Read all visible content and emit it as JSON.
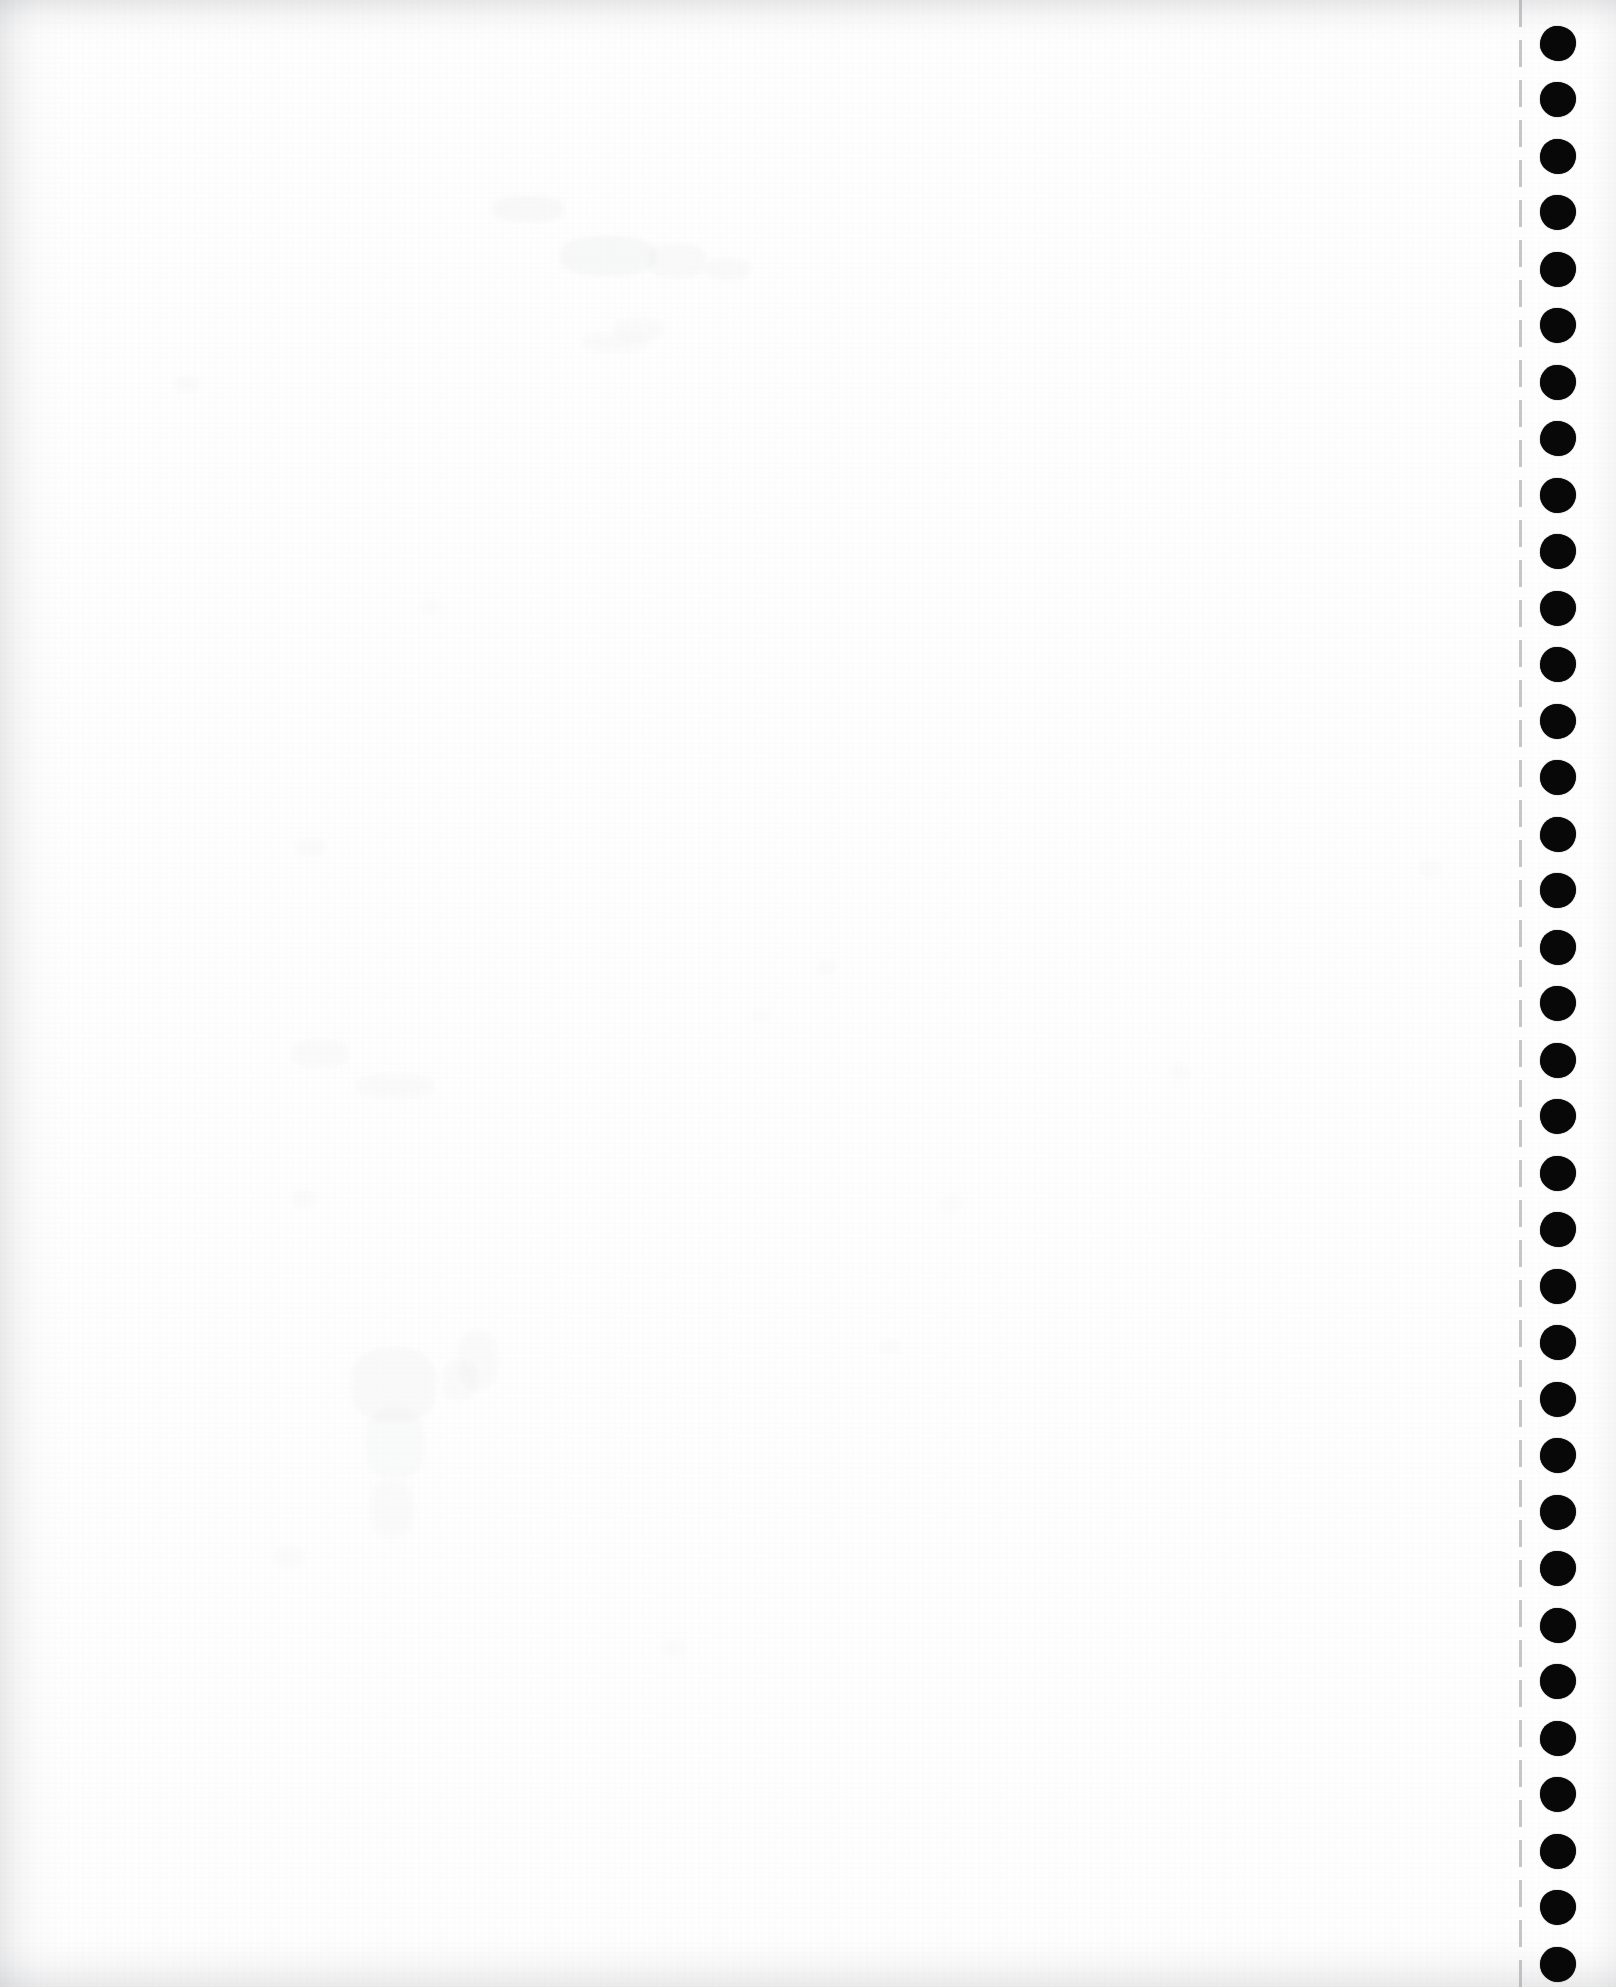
{
  "document": {
    "kind": "scanned-page",
    "media": "continuous tractor-feed fanfold computer paper",
    "page_state_label": "blank page",
    "width_px": 1616,
    "height_px": 1987,
    "background_color": "#ffffff",
    "ink_color": "#080808"
  },
  "content_area": {
    "label": "blank printable area",
    "text": "",
    "left_px": 0,
    "width_px": 1519,
    "visible_text_lines": []
  },
  "perforation": {
    "label": "tear-off perforation line",
    "x_px": 1519,
    "orientation": "vertical",
    "style": "dashed",
    "dash_length_px": 27,
    "gap_length_px": 13,
    "color": "#96989e"
  },
  "sprocket_strip": {
    "label": "pin-feed sprocket strip",
    "x_px": 1522,
    "width_px": 94,
    "hole_color": "#080808",
    "hole_diameter_px": 36,
    "hole_spacing_px": 56.5,
    "first_hole_center_y_px": 43,
    "hole_count": 35,
    "hole_centers_y_px": [
      43,
      99,
      156,
      212,
      269,
      325,
      382,
      438,
      495,
      551,
      608,
      664,
      721,
      777,
      834,
      890,
      947,
      1003,
      1060,
      1116,
      1173,
      1229,
      1286,
      1342,
      1399,
      1455,
      1512,
      1568,
      1625,
      1681,
      1738,
      1794,
      1851,
      1907,
      1964
    ]
  },
  "scan_artifacts": {
    "label": "scanner edge shading and paper grain",
    "edges": [
      "top",
      "left",
      "bottom",
      "right"
    ],
    "shade_color": "#96989c",
    "ghost_marks": [
      {
        "x": 492,
        "y": 196,
        "w": 72,
        "h": 26,
        "opacity": 0.05
      },
      {
        "x": 560,
        "y": 236,
        "w": 96,
        "h": 40,
        "opacity": 0.055
      },
      {
        "x": 648,
        "y": 244,
        "w": 58,
        "h": 34,
        "opacity": 0.045
      },
      {
        "x": 706,
        "y": 258,
        "w": 44,
        "h": 22,
        "opacity": 0.038
      },
      {
        "x": 614,
        "y": 318,
        "w": 50,
        "h": 22,
        "opacity": 0.03
      },
      {
        "x": 582,
        "y": 332,
        "w": 68,
        "h": 20,
        "opacity": 0.028
      },
      {
        "x": 174,
        "y": 376,
        "w": 26,
        "h": 16,
        "opacity": 0.028
      },
      {
        "x": 296,
        "y": 838,
        "w": 30,
        "h": 18,
        "opacity": 0.026
      },
      {
        "x": 818,
        "y": 960,
        "w": 18,
        "h": 14,
        "opacity": 0.024
      },
      {
        "x": 752,
        "y": 1010,
        "w": 16,
        "h": 12,
        "opacity": 0.022
      },
      {
        "x": 292,
        "y": 1040,
        "w": 56,
        "h": 28,
        "opacity": 0.032
      },
      {
        "x": 356,
        "y": 1074,
        "w": 78,
        "h": 24,
        "opacity": 0.03
      },
      {
        "x": 352,
        "y": 1348,
        "w": 84,
        "h": 74,
        "opacity": 0.042
      },
      {
        "x": 442,
        "y": 1360,
        "w": 36,
        "h": 40,
        "opacity": 0.03
      },
      {
        "x": 458,
        "y": 1330,
        "w": 40,
        "h": 60,
        "opacity": 0.03
      },
      {
        "x": 366,
        "y": 1408,
        "w": 58,
        "h": 70,
        "opacity": 0.034
      },
      {
        "x": 370,
        "y": 1480,
        "w": 44,
        "h": 58,
        "opacity": 0.028
      },
      {
        "x": 292,
        "y": 1190,
        "w": 24,
        "h": 18,
        "opacity": 0.022
      },
      {
        "x": 940,
        "y": 1196,
        "w": 22,
        "h": 16,
        "opacity": 0.02
      },
      {
        "x": 274,
        "y": 1546,
        "w": 30,
        "h": 22,
        "opacity": 0.022
      },
      {
        "x": 1170,
        "y": 1064,
        "w": 18,
        "h": 16,
        "opacity": 0.02
      },
      {
        "x": 1420,
        "y": 860,
        "w": 20,
        "h": 18,
        "opacity": 0.022
      },
      {
        "x": 880,
        "y": 1340,
        "w": 20,
        "h": 14,
        "opacity": 0.018
      },
      {
        "x": 660,
        "y": 1640,
        "w": 26,
        "h": 16,
        "opacity": 0.018
      },
      {
        "x": 420,
        "y": 600,
        "w": 22,
        "h": 14,
        "opacity": 0.018
      }
    ]
  }
}
